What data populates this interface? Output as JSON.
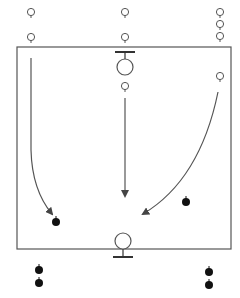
{
  "diagram": {
    "type": "sports-drill",
    "colors": {
      "background": "#ffffff",
      "line": "#555555",
      "attacker_fill": "#ffffff",
      "defender_fill": "#111111"
    },
    "field": {
      "x": 17,
      "y": 47,
      "width": 214,
      "height": 202
    },
    "goals": [
      {
        "id": "top-goal",
        "circle": {
          "cx": 125,
          "cy": 67,
          "r": 8
        },
        "bar": {
          "x1": 115,
          "x2": 135,
          "y": 52
        },
        "post": {
          "y1": 52,
          "y2": 59
        }
      },
      {
        "id": "bottom-goal",
        "circle": {
          "cx": 123,
          "cy": 241,
          "r": 8
        },
        "bar": {
          "x1": 113,
          "x2": 133,
          "y": 257
        },
        "post": {
          "y1": 249,
          "y2": 257
        }
      }
    ],
    "open_players": [
      {
        "cx": 31,
        "cy": 13
      },
      {
        "cx": 31,
        "cy": 38
      },
      {
        "cx": 125,
        "cy": 13
      },
      {
        "cx": 125,
        "cy": 38
      },
      {
        "cx": 220,
        "cy": 13
      },
      {
        "cx": 220,
        "cy": 25
      },
      {
        "cx": 220,
        "cy": 37
      },
      {
        "cx": 125,
        "cy": 87
      },
      {
        "cx": 220,
        "cy": 77
      }
    ],
    "solid_players": [
      {
        "cx": 56,
        "cy": 222
      },
      {
        "cx": 186,
        "cy": 202
      },
      {
        "cx": 39,
        "cy": 270
      },
      {
        "cx": 39,
        "cy": 283
      },
      {
        "cx": 209,
        "cy": 272
      },
      {
        "cx": 209,
        "cy": 285
      }
    ],
    "arrows": [
      {
        "id": "left-run",
        "d": "M31 58 L31 150 Q32 190 52 214"
      },
      {
        "id": "center-run",
        "d": "M125 98 L125 196"
      },
      {
        "id": "right-run",
        "d": "M218 92 Q200 180 143 214"
      }
    ]
  }
}
